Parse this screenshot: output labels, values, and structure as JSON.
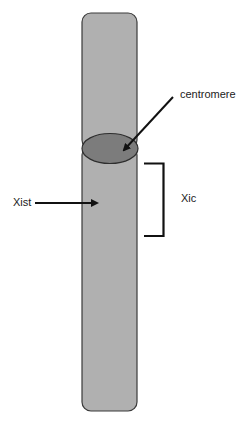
{
  "diagram": {
    "type": "chromosome",
    "labels": {
      "centromere": "centromere",
      "xic": "Xic",
      "xist": "Xist"
    },
    "colors": {
      "chromosome_fill": "#b0b0b0",
      "centromere_fill": "#7c7c7c",
      "outline": "#3a3a3a",
      "arrow": "#111111"
    }
  }
}
